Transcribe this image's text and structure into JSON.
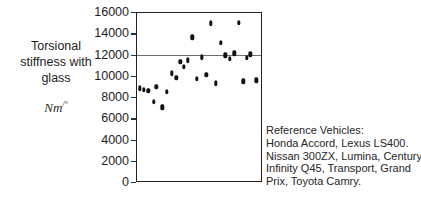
{
  "axis": {
    "ylabel_lines": [
      "Torsional",
      "stiffness with",
      "glass"
    ],
    "units_base": "Nm",
    "units_sup": "/°",
    "ticks": [
      "16000",
      "14000",
      "12000",
      "10000",
      "8000",
      "6000",
      "4000",
      "2000",
      "0"
    ]
  },
  "note": {
    "lines": [
      "Reference Vehicles:",
      "Honda Accord, Lexus LS400.",
      "Nissan 300ZX, Lumina, Century,",
      "Infinity Q45, Transport, Grand",
      "Prix, Toyota Camry."
    ]
  },
  "colors": {
    "marker": "#111111",
    "frame": "#202020",
    "reference_line": "#6e6e6e",
    "text": "#1d1d1d",
    "background": "#ffffff"
  },
  "chart_data": {
    "type": "scatter",
    "title": "",
    "xlabel": "",
    "ylabel": "Torsional stiffness with glass Nm/°",
    "ylim": [
      0,
      16000
    ],
    "xlim": [
      0,
      26
    ],
    "yticks": [
      0,
      2000,
      4000,
      6000,
      8000,
      10000,
      12000,
      14000,
      16000
    ],
    "grid": false,
    "legend": null,
    "annotations": [
      "Reference Vehicles: Honda Accord, Lexus LS400. Nissan 300ZX, Lumina, Century, Infinity Q45, Transport, Grand Prix, Toyota Camry."
    ],
    "reference_lines": [
      {
        "orientation": "horizontal",
        "y": 12050,
        "color": "#6e6e6e"
      }
    ],
    "x": [
      0.6,
      1.4,
      2.3,
      3.5,
      4.0,
      5.2,
      6.2,
      7.2,
      8.1,
      8.9,
      9.6,
      10.5,
      11.4,
      12.3,
      13.4,
      14.3,
      15.2,
      16.3,
      17.3,
      18.2,
      19.2,
      20.1,
      21.0,
      21.9,
      22.6,
      23.4,
      24.6
    ],
    "y": [
      8950,
      8800,
      8700,
      7650,
      9050,
      7150,
      8600,
      10350,
      9900,
      11400,
      10950,
      11550,
      13700,
      9800,
      11850,
      10200,
      15050,
      9400,
      13200,
      12050,
      11700,
      12200,
      15100,
      9600,
      11800,
      12100,
      9650
    ],
    "values": [
      {
        "x": 0.6,
        "y": 8950
      },
      {
        "x": 1.4,
        "y": 8800
      },
      {
        "x": 2.3,
        "y": 8700
      },
      {
        "x": 3.5,
        "y": 7650
      },
      {
        "x": 4.0,
        "y": 9050
      },
      {
        "x": 5.2,
        "y": 7150
      },
      {
        "x": 6.2,
        "y": 8600
      },
      {
        "x": 7.2,
        "y": 10350
      },
      {
        "x": 8.1,
        "y": 9900
      },
      {
        "x": 8.9,
        "y": 11400
      },
      {
        "x": 9.6,
        "y": 10950
      },
      {
        "x": 10.5,
        "y": 11550
      },
      {
        "x": 11.4,
        "y": 13700
      },
      {
        "x": 12.3,
        "y": 9800
      },
      {
        "x": 13.4,
        "y": 11850
      },
      {
        "x": 14.3,
        "y": 10200
      },
      {
        "x": 15.2,
        "y": 15050
      },
      {
        "x": 16.3,
        "y": 9400
      },
      {
        "x": 17.3,
        "y": 13200
      },
      {
        "x": 18.2,
        "y": 12050
      },
      {
        "x": 19.2,
        "y": 11700
      },
      {
        "x": 20.1,
        "y": 12200
      },
      {
        "x": 21.0,
        "y": 15100
      },
      {
        "x": 21.9,
        "y": 9600
      },
      {
        "x": 22.6,
        "y": 11800
      },
      {
        "x": 23.4,
        "y": 12100
      },
      {
        "x": 24.6,
        "y": 9650
      }
    ]
  }
}
